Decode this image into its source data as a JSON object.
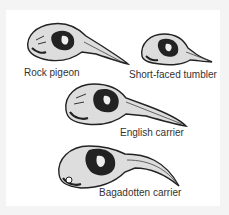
{
  "figure": {
    "background": "#ffffff",
    "specimens": [
      {
        "label": "Rock pigeon"
      },
      {
        "label": "Short-faced tumbler"
      },
      {
        "label": "English carrier"
      },
      {
        "label": "Bagadotten carrier"
      }
    ],
    "ink_color": "#222222",
    "label_color": "#333333"
  }
}
